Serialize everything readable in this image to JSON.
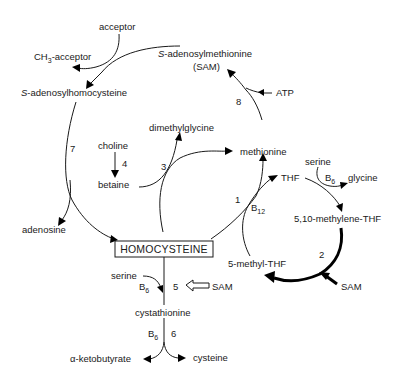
{
  "colors": {
    "ink": "#1a1a1a",
    "background": "#ffffff"
  },
  "nodes": {
    "acceptor": "acceptor",
    "ch3_acceptor_prefix": "CH",
    "ch3_acceptor_sub": "3",
    "ch3_acceptor_suffix": "-acceptor",
    "sam_italic": "S",
    "sam_rest": "-adenosylmethionine",
    "sam_abbr": "(SAM)",
    "sah_italic": "S",
    "sah_rest": "-adenosylhomocysteine",
    "atp": "ATP",
    "dimethylglycine": "dimethylglycine",
    "choline": "choline",
    "betaine": "betaine",
    "methionine": "methionine",
    "serine_top": "serine",
    "glycine": "glycine",
    "thf": "THF",
    "b12_base": "B",
    "b12_sub": "12",
    "b6_top_base": "B",
    "b6_top_sub": "6",
    "methylene_thf": "5,10-methylene-THF",
    "adenosine": "adenosine",
    "homocysteine": "HOMOCYSTEINE",
    "methyl_thf": "5-methyl-THF",
    "sam_right": "SAM",
    "serine_bottom": "serine",
    "b6_mid_base": "B",
    "b6_mid_sub": "6",
    "sam_mid": "SAM",
    "cystathionine": "cystathionine",
    "b6_low_base": "B",
    "b6_low_sub": "6",
    "alpha_ketobutyrate": "α-ketobutyrate",
    "cysteine": "cysteine"
  },
  "enzyme_steps": {
    "s1": "1",
    "s2": "2",
    "s3": "3",
    "s4": "4",
    "s5": "5",
    "s6": "6",
    "s7": "7",
    "s8": "8"
  }
}
